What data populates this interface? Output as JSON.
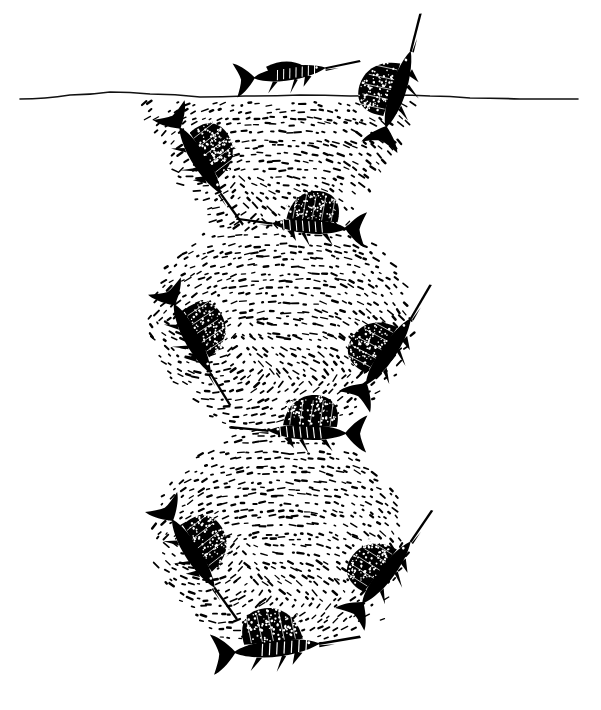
{
  "illustration": {
    "title": "Bait ball herded by billfish",
    "medium": "pen-and-ink line drawing",
    "background_color": "#ffffff",
    "ink_color": "#000000",
    "canvas": {
      "width": 601,
      "height": 710
    }
  },
  "surface": {
    "name": "water-surface-line",
    "label": "sea surface",
    "x_start": 20,
    "x_end": 578,
    "y_baseline": 97,
    "stroke_color": "#111111",
    "stroke_width": 1.6,
    "waypoints": [
      [
        20,
        99
      ],
      [
        70,
        95
      ],
      [
        110,
        92
      ],
      [
        150,
        94
      ],
      [
        200,
        97
      ],
      [
        245,
        96
      ],
      [
        300,
        95
      ],
      [
        350,
        96
      ],
      [
        395,
        95
      ],
      [
        430,
        96
      ],
      [
        470,
        98
      ],
      [
        520,
        99
      ],
      [
        578,
        99
      ]
    ]
  },
  "bait_ball": {
    "name": "bait-ball",
    "label": "school of small baitfish",
    "shape": "hourglass of three stacked lobes",
    "dash_color": "#000000",
    "lobes": [
      {
        "id": "upper-lobe",
        "label": "upper lobe (surface cone)",
        "cx": 278,
        "cy": 158,
        "rx": 140,
        "ry": 64,
        "top_flat": true,
        "density": 1.0
      },
      {
        "id": "middle-lobe",
        "label": "middle lobe (sphere)",
        "cx": 282,
        "cy": 320,
        "rx": 133,
        "ry": 108,
        "top_flat": false,
        "density": 1.0
      },
      {
        "id": "lower-lobe",
        "label": "lower lobe (sphere)",
        "cx": 280,
        "cy": 540,
        "rx": 128,
        "ry": 110,
        "top_flat": false,
        "density": 1.0
      }
    ],
    "waists": [
      {
        "id": "upper-waist",
        "cy": 232,
        "half_width": 62
      },
      {
        "id": "lower-waist",
        "cy": 438,
        "half_width": 66
      }
    ],
    "dash_count_estimate": 2400,
    "dash_length_px": [
      3,
      9
    ],
    "dash_thickness_px": [
      1.2,
      2.6
    ]
  },
  "predators": [
    {
      "id": "marlin-above-surface",
      "name": "marlin-free-swimming",
      "species_label": "marlin",
      "x": 289,
      "y": 73,
      "length": 78,
      "angle": -8,
      "facing": "right",
      "sail_raised": false,
      "striped": true,
      "position_note": "above the surface line, free swimming"
    },
    {
      "id": "sailfish-surface-right",
      "name": "sailfish-breaching-surface",
      "species_label": "sailfish",
      "x": 398,
      "y": 90,
      "length": 86,
      "angle": -72,
      "facing": "up-right",
      "sail_raised": true,
      "striped": false,
      "position_note": "bill piercing the surface at the right edge of the upper lobe"
    },
    {
      "id": "sailfish-upper-left",
      "name": "sailfish-upper-left",
      "species_label": "sailfish",
      "x": 200,
      "y": 160,
      "length": 84,
      "angle": 58,
      "facing": "down-right",
      "sail_raised": true,
      "striped": false,
      "position_note": "left flank of upper lobe"
    },
    {
      "id": "sailfish-upper-waist",
      "name": "sailfish-upper-waist",
      "species_label": "sailfish",
      "x": 310,
      "y": 226,
      "length": 80,
      "angle": 4,
      "facing": "left",
      "sail_raised": true,
      "striped": true,
      "position_note": "horizontal, at the waist between upper and middle lobes"
    },
    {
      "id": "sailfish-middle-left",
      "name": "sailfish-middle-left",
      "species_label": "sailfish",
      "x": 192,
      "y": 338,
      "length": 84,
      "angle": 62,
      "facing": "down-right",
      "sail_raised": true,
      "striped": false,
      "position_note": "left flank of middle lobe"
    },
    {
      "id": "sailfish-middle-right",
      "name": "sailfish-middle-right",
      "species_label": "sailfish",
      "x": 388,
      "y": 352,
      "length": 86,
      "angle": -56,
      "facing": "up-right",
      "sail_raised": true,
      "striped": false,
      "position_note": "right flank of middle lobe"
    },
    {
      "id": "sailfish-lower-waist",
      "name": "sailfish-lower-waist",
      "species_label": "sailfish",
      "x": 308,
      "y": 432,
      "length": 84,
      "angle": 2,
      "facing": "left",
      "sail_raised": true,
      "striped": true,
      "position_note": "horizontal, at the waist between middle and lower lobes"
    },
    {
      "id": "sailfish-lower-left",
      "name": "sailfish-lower-left",
      "species_label": "sailfish",
      "x": 193,
      "y": 553,
      "length": 86,
      "angle": 58,
      "facing": "down-right",
      "sail_raised": true,
      "striped": false,
      "position_note": "left flank of lower lobe"
    },
    {
      "id": "sailfish-lower-right",
      "name": "sailfish-lower-right",
      "species_label": "sailfish",
      "x": 386,
      "y": 573,
      "length": 84,
      "angle": -52,
      "facing": "up-right",
      "sail_raised": true,
      "striped": false,
      "position_note": "right flank of lower lobe"
    },
    {
      "id": "sailfish-bottom",
      "name": "sailfish-bottom",
      "species_label": "sailfish",
      "x": 276,
      "y": 648,
      "length": 92,
      "angle": -6,
      "facing": "right",
      "sail_raised": true,
      "striped": true,
      "position_note": "beneath the lower lobe, rising toward the ball"
    }
  ]
}
